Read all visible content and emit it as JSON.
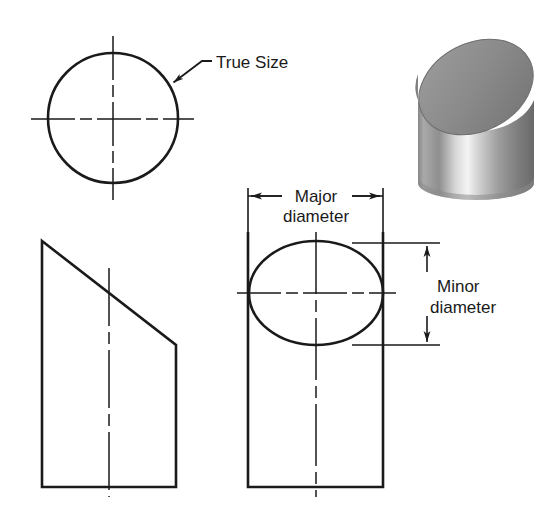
{
  "figure": {
    "background_color": "#ffffff",
    "line_color": "#1a1a1a",
    "width": 549,
    "height": 528
  },
  "labels": {
    "true_size": "True Size",
    "major_line1": "Major",
    "major_line2": "diameter",
    "minor_line1": "Minor",
    "minor_line2": "diameter"
  },
  "views": {
    "auxiliary_view": {
      "name": "true-size-circle-view",
      "shape": "circle",
      "center_x": 113,
      "center_y": 118,
      "radius": 65
    },
    "front_view": {
      "name": "front-view-trapezoid",
      "shape": "trapezoid",
      "left": 42,
      "right": 176,
      "top": 241,
      "bottom": 487,
      "slope_right_y": 345
    },
    "side_view": {
      "name": "side-view-rectangle-with-ellipse",
      "shape": "rectangle",
      "left": 248,
      "right": 383,
      "bottom": 487,
      "ellipse_center_x": 316,
      "ellipse_center_y": 293,
      "ellipse_rx": 67,
      "ellipse_ry": 52
    },
    "pictorial": {
      "name": "shaded-cylinder-pictorial",
      "shape": "cylinder-oblique-cut",
      "left": 418,
      "right": 534,
      "top": 30,
      "bottom": 196
    }
  },
  "dimensions": {
    "major": {
      "orientation": "horizontal",
      "y": 196,
      "x_start": 248,
      "x_end": 383
    },
    "minor": {
      "orientation": "vertical",
      "x": 427,
      "y_start": 243,
      "y_end": 345
    }
  },
  "colors": {
    "line": "#1a1a1a",
    "text": "#1a1a1a",
    "cylinder_light": "#f2f2f2",
    "cylinder_mid": "#9a9a9a",
    "cylinder_dark": "#6f6f6f",
    "cylinder_top_face": "#8c8c8c"
  }
}
